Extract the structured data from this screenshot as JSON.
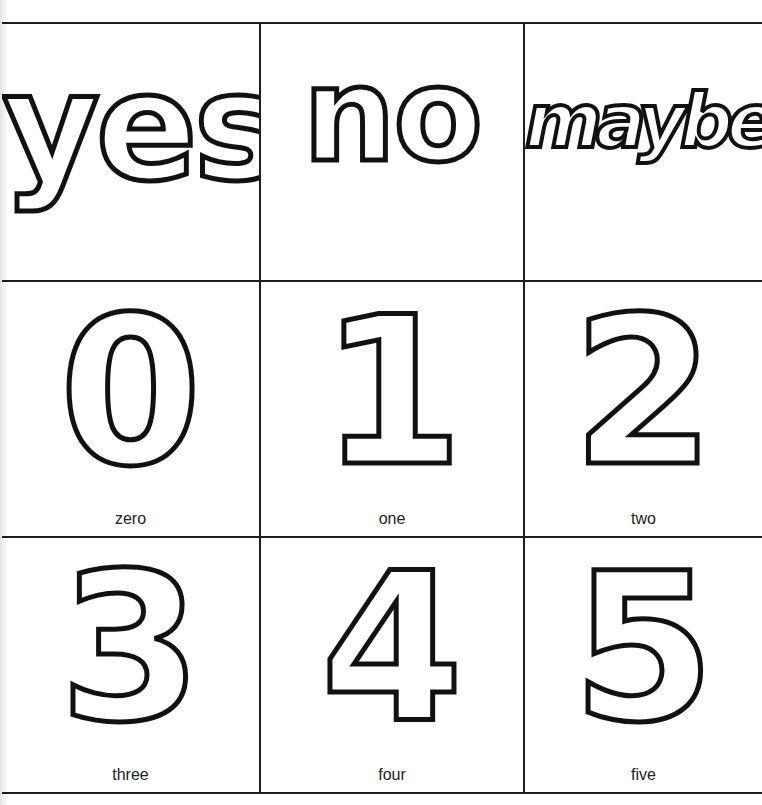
{
  "worksheet": {
    "colors": {
      "ink": "#1e1e1e",
      "paper": "#ffffff"
    },
    "rows": [
      {
        "cells": [
          {
            "glyph": "yes",
            "caption": ""
          },
          {
            "glyph": "no",
            "caption": ""
          },
          {
            "glyph": "maybe",
            "caption": ""
          }
        ]
      },
      {
        "cells": [
          {
            "glyph": "0",
            "caption": "zero"
          },
          {
            "glyph": "1",
            "caption": "one"
          },
          {
            "glyph": "2",
            "caption": "two"
          }
        ]
      },
      {
        "cells": [
          {
            "glyph": "3",
            "caption": "three"
          },
          {
            "glyph": "4",
            "caption": "four"
          },
          {
            "glyph": "5",
            "caption": "five"
          }
        ]
      }
    ]
  }
}
